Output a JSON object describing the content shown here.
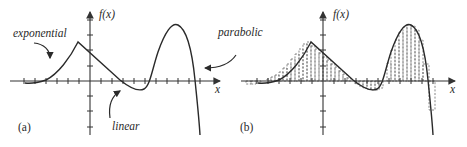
{
  "figure": {
    "panels": [
      {
        "id": "a",
        "panel_label": "(a)",
        "y_axis_label": "f(x)",
        "x_axis_label": "x",
        "annotations": {
          "exponential": "exponential",
          "linear": "linear",
          "parabolic": "parabolic"
        }
      },
      {
        "id": "b",
        "panel_label": "(b)",
        "y_axis_label": "f(x)",
        "x_axis_label": "x",
        "note": "same curve with dashed rectangular strips approximating the area under the curve"
      }
    ],
    "colors": {
      "curve": "#2a2a2a",
      "axes": "#333333",
      "strips": "#555555",
      "background": "#ffffff"
    }
  }
}
